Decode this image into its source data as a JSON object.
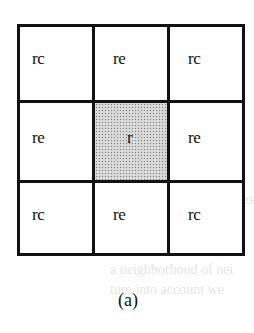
{
  "figure": {
    "caption": "(a)",
    "center_fill": "#d9d9d9",
    "grid": [
      [
        {
          "label": "rc",
          "shaded": false
        },
        {
          "label": "re",
          "shaded": false
        },
        {
          "label": "rc",
          "shaded": false
        }
      ],
      [
        {
          "label": "re",
          "shaded": false
        },
        {
          "label": "r",
          "shaded": true
        },
        {
          "label": "re",
          "shaded": false
        }
      ],
      [
        {
          "label": "rc",
          "shaded": false
        },
        {
          "label": "re",
          "shaded": false
        },
        {
          "label": "rc",
          "shaded": false
        }
      ]
    ]
  },
  "bleed_through_text": [
    "for less random",
    "common approach (Coles",
    "different types",
    "a neighborhood of nei",
    "ture into account we"
  ]
}
